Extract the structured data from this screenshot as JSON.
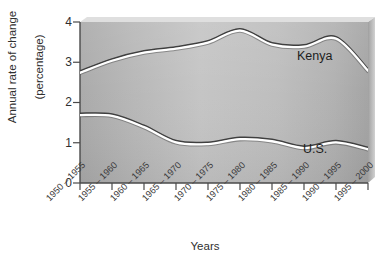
{
  "chart_data": {
    "type": "line",
    "title": "",
    "xlabel": "Years",
    "ylabel": "Annual rate of change\n(percentage)",
    "ylabel_line1": "Annual rate of change",
    "ylabel_line2": "(percentage)",
    "categories": [
      "1950 – 1955",
      "1955 – 1960",
      "1960 – 1965",
      "1965 – 1970",
      "1970 – 1975",
      "1975 – 1980",
      "1980 – 1985",
      "1985 – 1990",
      "1990 – 1995",
      "1995 – 2000"
    ],
    "ylim": [
      0,
      4
    ],
    "yticks": [
      "0",
      "1",
      "2",
      "3",
      "4"
    ],
    "ytick_values": [
      0,
      1,
      2,
      3,
      4
    ],
    "grid": false,
    "legend": "inline-labels",
    "series": [
      {
        "name": "Kenya",
        "label": "Kenya",
        "values": [
          2.75,
          3.05,
          3.25,
          3.35,
          3.5,
          3.8,
          3.45,
          3.4,
          3.6,
          2.8
        ],
        "color": "#555555"
      },
      {
        "name": "U.S.",
        "label": "U.S.",
        "values": [
          1.7,
          1.68,
          1.4,
          1.02,
          0.98,
          1.1,
          1.05,
          0.88,
          1.02,
          0.85
        ],
        "color": "#555555"
      }
    ]
  },
  "figure": {
    "background": "#bdbdbd",
    "line_color": "#4a4a4a",
    "highlight_color": "#ffffff",
    "axis_color": "#4a4a4a"
  }
}
